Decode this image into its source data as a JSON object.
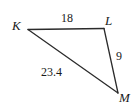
{
  "figure": {
    "kind": "triangle-diagram",
    "background_color": "#ffffff",
    "stroke_color": "#2b2b2b",
    "text_color": "#1a1a1a"
  },
  "vertices": [
    {
      "name": "K",
      "label": "K",
      "x": 28,
      "y": 29
    },
    {
      "name": "L",
      "label": "L",
      "x": 104,
      "y": 28
    },
    {
      "name": "M",
      "label": "M",
      "x": 118,
      "y": 93
    }
  ],
  "sides": [
    {
      "name": "KL",
      "label": "18",
      "from": "K",
      "to": "L"
    },
    {
      "name": "LM",
      "label": "9",
      "from": "L",
      "to": "M"
    },
    {
      "name": "KM",
      "label": "23.4",
      "from": "K",
      "to": "M"
    }
  ],
  "labels": {
    "vertex_K": "K",
    "vertex_L": "L",
    "vertex_M": "M",
    "side_KL": "18",
    "side_LM": "9",
    "side_KM": "23.4"
  }
}
